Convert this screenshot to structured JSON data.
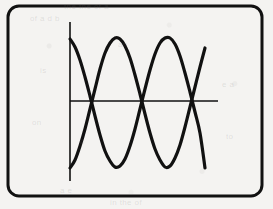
{
  "figure": {
    "background_color": "#f4f3f1",
    "ink_color": "#111111",
    "frame": {
      "name": "rounded-rectangle-border",
      "x": 8,
      "y": 6,
      "width": 254,
      "height": 190,
      "corner_radius": 11,
      "stroke_width": 3,
      "stroke_color": "#111111"
    },
    "axes": {
      "stroke_width": 1.6,
      "stroke_color": "#111111",
      "vertical_axis": {
        "x": 70,
        "y_top": 22,
        "y_bottom": 181
      },
      "horizontal_axis": {
        "y": 101,
        "x_left": 70,
        "x_right": 218
      }
    },
    "curve_stroke_width": 3.2
  },
  "chart_data": {
    "type": "line",
    "xlabel": "",
    "ylabel": "",
    "grid": false,
    "legend": "none",
    "axis_origin_px": {
      "x": 70,
      "y": 101
    },
    "xlim_px": [
      70,
      205
    ],
    "ylim_px": [
      37,
      169
    ],
    "amplitude_px": 64,
    "period_px": 86,
    "x_samples_px": [
      70,
      75,
      80,
      85,
      90,
      95,
      100,
      105,
      110,
      115,
      120,
      125,
      130,
      135,
      140,
      145,
      150,
      155,
      160,
      165,
      170,
      175,
      180,
      185,
      190,
      195,
      200,
      205
    ],
    "series": [
      {
        "name": "wave-descending-start",
        "phase_deg": 150,
        "start_point_px": {
          "x": 70,
          "y": 39
        },
        "end_point_px": {
          "x": 205,
          "y": 168
        },
        "peaks_px": [
          {
            "x": 148,
            "y": 37
          }
        ],
        "troughs_px": [
          {
            "x": 105,
            "y": 167
          },
          {
            "x": 191,
            "y": 166
          }
        ],
        "values_px": [
          39,
          47,
          60,
          77,
          96,
          116,
          135,
          151,
          161,
          167,
          166,
          159,
          146,
          129,
          109,
          89,
          70,
          54,
          43,
          38,
          38,
          44,
          56,
          73,
          92,
          112,
          133,
          168
        ]
      },
      {
        "name": "wave-ascending-start",
        "phase_deg": 330,
        "start_point_px": {
          "x": 70,
          "y": 168
        },
        "end_point_px": {
          "x": 205,
          "y": 48
        },
        "peaks_px": [
          {
            "x": 103,
            "y": 36
          },
          {
            "x": 190,
            "y": 36
          }
        ],
        "troughs_px": [
          {
            "x": 125,
            "y": 168
          },
          {
            "x": 168,
            "y": 167
          }
        ],
        "values_px": [
          168,
          160,
          146,
          129,
          109,
          89,
          69,
          53,
          43,
          38,
          39,
          46,
          58,
          75,
          94,
          114,
          133,
          149,
          160,
          167,
          166,
          158,
          145,
          127,
          107,
          87,
          67,
          48
        ]
      }
    ]
  },
  "annotations": {
    "ghost_lines": [
      {
        "text": "the the of a",
        "x": 64,
        "y": 2
      },
      {
        "text": "of a d b",
        "x": 30,
        "y": 14
      },
      {
        "text": "an",
        "x": 118,
        "y": 40
      },
      {
        "text": "is",
        "x": 40,
        "y": 66
      },
      {
        "text": "e  a",
        "x": 222,
        "y": 80
      },
      {
        "text": "on",
        "x": 32,
        "y": 118
      },
      {
        "text": "to",
        "x": 226,
        "y": 132
      },
      {
        "text": "a e",
        "x": 60,
        "y": 186
      },
      {
        "text": "in the of",
        "x": 110,
        "y": 198
      }
    ]
  }
}
